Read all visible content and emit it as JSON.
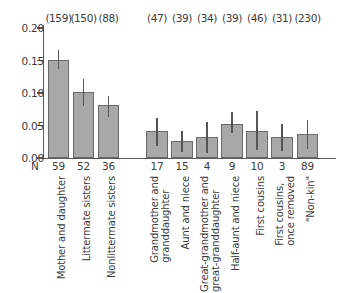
{
  "chart_data": {
    "type": "bar",
    "title": "",
    "xlabel": "",
    "ylabel": "",
    "ylim": [
      0.0,
      0.2
    ],
    "ytick_labels": [
      "0.00",
      "0.05",
      "0.10",
      "0.15",
      "0.20"
    ],
    "ytick_values": [
      0.0,
      0.05,
      0.1,
      0.15,
      0.2
    ],
    "grid": false,
    "legend": "none",
    "n_axis_label": "N",
    "categories": [
      "Mother and daughter",
      "Littermate sisters",
      "Nonlittermate sisters",
      "Grandmother and\ngranddaughter",
      "Aunt and niece",
      "Great-grandmother and\ngreat-granddaughter",
      "Half-aunt and niece",
      "First cousins",
      "First cousins,\nonce removed",
      "\"Non-kin\""
    ],
    "values": [
      0.151,
      0.101,
      0.082,
      0.041,
      0.026,
      0.032,
      0.052,
      0.042,
      0.032,
      0.037
    ],
    "err_low": [
      0.137,
      0.08,
      0.063,
      0.019,
      0.009,
      0.007,
      0.038,
      0.012,
      0.01,
      0.014
    ],
    "err_high": [
      0.166,
      0.122,
      0.096,
      0.062,
      0.042,
      0.055,
      0.071,
      0.073,
      0.052,
      0.058
    ],
    "n_values": [
      "59",
      "52",
      "36",
      "17",
      "15",
      "4",
      "9",
      "10",
      "3",
      "89"
    ],
    "count_labels": [
      "(159)",
      "(150)",
      "(88)",
      "(47)",
      "(39)",
      "(34)",
      "(39)",
      "(46)",
      "(31)",
      "(230)"
    ],
    "bar_color": "#a8a8a8",
    "bar_border_color": "#6a6a6a",
    "error_color": "#555555",
    "axis_color": "#5a5a5a",
    "text_color": "#3c3c3c"
  }
}
